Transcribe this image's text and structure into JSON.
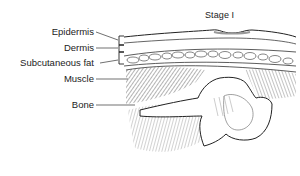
{
  "title": "Stage I",
  "labels": {
    "epidermis": "Epidermis",
    "dermis": "Dermis",
    "subcutaneous_fat": "Subcutaneous fat",
    "muscle": "Muscle",
    "bone": "Bone"
  }
}
